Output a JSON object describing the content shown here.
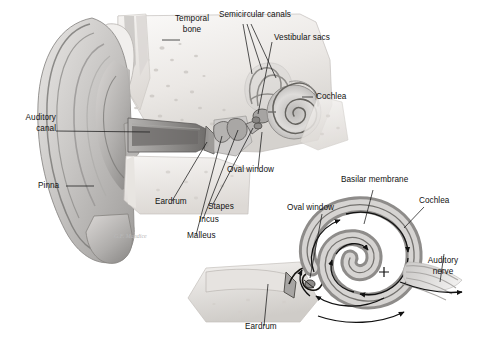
{
  "figure": {
    "background_color": "#ffffff",
    "label_color": "#111111",
    "leader_line_color": "#1a1a1a",
    "signature": "G.F. Mandice"
  },
  "labels": {
    "temporal_bone": "Temporal\nbone",
    "temporal_bone_line1": "Temporal",
    "temporal_bone_line2": "bone",
    "semicircular_canals": "Semicircular canals",
    "vestibular_sacs": "Vestibular sacs",
    "cochlea_upper": "Cochlea",
    "auditory_canal_line1": "Auditory",
    "auditory_canal_line2": "canal",
    "pinna": "Pinna",
    "eardrum_upper": "Eardrum",
    "malleus": "Malleus",
    "incus": "Incus",
    "stapes": "Stapes",
    "oval_window_upper": "Oval window",
    "basilar_membrane": "Basilar membrane",
    "oval_window_lower": "Oval window",
    "cochlea_lower": "Cochlea",
    "auditory_nerve_line1": "Auditory",
    "auditory_nerve_line2": "nerve",
    "eardrum_lower": "Eardrum"
  },
  "panels": {
    "upper": {
      "name": "cross-section-of-whole-ear",
      "parts": [
        "Pinna",
        "Auditory canal",
        "Temporal bone",
        "Eardrum",
        "Malleus",
        "Incus",
        "Stapes",
        "Oval window",
        "Semicircular canals",
        "Vestibular sacs",
        "Cochlea"
      ]
    },
    "lower": {
      "name": "detail-of-middle-and-inner-ear",
      "parts": [
        "Eardrum",
        "Oval window",
        "Basilar membrane",
        "Cochlea",
        "Auditory nerve"
      ],
      "flow_arrows": "sound-pressure-wave-direction"
    }
  },
  "palette": {
    "ink": "#111111",
    "bone_light": "#f2f0ee",
    "bone_mid": "#d9d6d2",
    "tissue_mid": "#bdbcbb",
    "tissue_dark": "#8d8c8b",
    "shadow": "#6f6e6d",
    "outline": "#5a5a5a"
  }
}
